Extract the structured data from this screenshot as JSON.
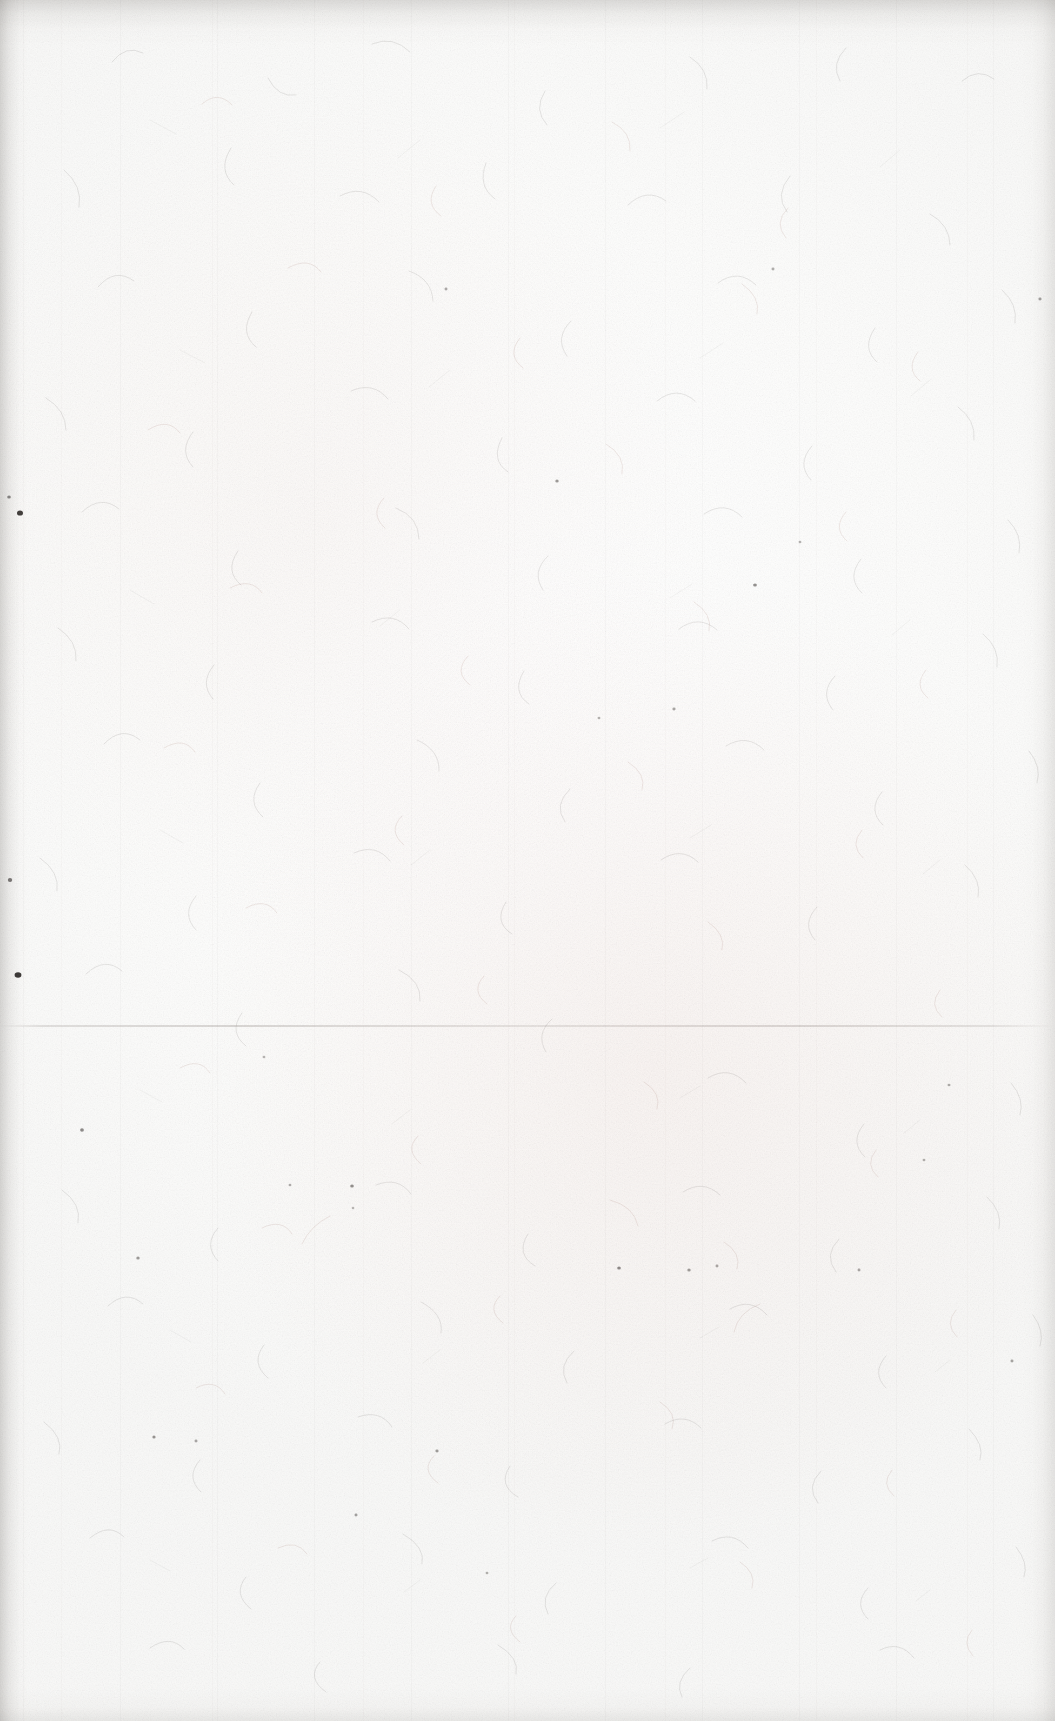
{
  "page": {
    "kind": "scanned-document-page",
    "content_state": "blank",
    "visible_text": "",
    "width": 1055,
    "height": 1721
  },
  "colors": {
    "paper_base": "#fdfdfc",
    "paper_highlight": "#ffffff",
    "paper_shadow": "#f7f6f5",
    "warm_cast": "#f7eeec",
    "fiber_grey": "#c9c7c6",
    "fiber_warm": "#c9aea8",
    "speck_dark": "#35312f",
    "edge_shadow": "#bcbab8",
    "seam_line": "#cecac8"
  },
  "features": {
    "seam": {
      "label": "horizontal scan seam",
      "y": 1025,
      "spans_full_width": true
    },
    "edges": [
      {
        "label": "top edge shadow",
        "side": "top",
        "extent_px": 46
      },
      {
        "label": "left edge shadow",
        "side": "left",
        "extent_px": 30
      },
      {
        "label": "right edge shadow",
        "side": "right",
        "extent_px": 34
      },
      {
        "label": "bottom edge shadow",
        "side": "bottom",
        "extent_px": 34
      }
    ],
    "specks": [
      {
        "x": 20,
        "y": 513,
        "r": 3.0
      },
      {
        "x": 18,
        "y": 975,
        "r": 3.4
      },
      {
        "x": 10,
        "y": 880,
        "r": 2.2
      },
      {
        "x": 9,
        "y": 497,
        "r": 1.8
      },
      {
        "x": 82,
        "y": 1130,
        "r": 1.9
      },
      {
        "x": 138,
        "y": 1258,
        "r": 1.7
      },
      {
        "x": 154,
        "y": 1437,
        "r": 1.6
      },
      {
        "x": 196,
        "y": 1441,
        "r": 1.5
      },
      {
        "x": 290,
        "y": 1185,
        "r": 1.4
      },
      {
        "x": 352,
        "y": 1186,
        "r": 1.8
      },
      {
        "x": 356,
        "y": 1515,
        "r": 1.5
      },
      {
        "x": 437,
        "y": 1451,
        "r": 1.6
      },
      {
        "x": 446,
        "y": 289,
        "r": 1.5
      },
      {
        "x": 487,
        "y": 1573,
        "r": 1.4
      },
      {
        "x": 557,
        "y": 481,
        "r": 1.7
      },
      {
        "x": 599,
        "y": 718,
        "r": 1.4
      },
      {
        "x": 619,
        "y": 1268,
        "r": 1.8
      },
      {
        "x": 674,
        "y": 709,
        "r": 1.6
      },
      {
        "x": 689,
        "y": 1270,
        "r": 1.7
      },
      {
        "x": 717,
        "y": 1266,
        "r": 1.5
      },
      {
        "x": 755,
        "y": 585,
        "r": 1.9
      },
      {
        "x": 773,
        "y": 269,
        "r": 1.5
      },
      {
        "x": 800,
        "y": 542,
        "r": 1.4
      },
      {
        "x": 859,
        "y": 1270,
        "r": 1.5
      },
      {
        "x": 924,
        "y": 1160,
        "r": 1.4
      },
      {
        "x": 1012,
        "y": 1361,
        "r": 1.5
      },
      {
        "x": 1040,
        "y": 299,
        "r": 1.6
      },
      {
        "x": 949,
        "y": 1085,
        "r": 1.5
      },
      {
        "x": 264,
        "y": 1057,
        "r": 1.4
      },
      {
        "x": 353,
        "y": 1208,
        "r": 1.3
      }
    ]
  }
}
